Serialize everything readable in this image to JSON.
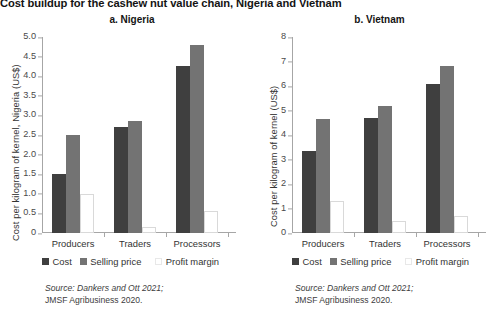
{
  "figure": {
    "title": "Cost buildup for the cashew nut value chain, Nigeria and Vietnam"
  },
  "legend": {
    "cost_label": "Cost",
    "selling_label": "Selling price",
    "profit_label": "Profit margin",
    "cost_color": "#3f3f3f",
    "selling_color": "#737373",
    "profit_color": "#ffffff"
  },
  "source": {
    "line1": "Source: Dankers and Ott 2021;",
    "line2": "JMSF Agribusiness 2020."
  },
  "chart_data": [
    {
      "type": "bar",
      "title": "a. Nigeria",
      "xlabel": "",
      "ylabel": "Cost per kilogram of kernel, Nigeria (US$)",
      "ylim": [
        0,
        5.0
      ],
      "ytick_step": 0.5,
      "ytick_labels": [
        "5.0",
        "4.5",
        "4.0",
        "3.5",
        "3.0",
        "2.5",
        "2.0",
        "1.5",
        "1.0",
        "0.5",
        "0"
      ],
      "ytick_values": [
        5.0,
        4.5,
        4.0,
        3.5,
        3.0,
        2.5,
        2.0,
        1.5,
        1.0,
        0.5,
        0
      ],
      "grid": false,
      "legend_position": "bottom",
      "categories": [
        "Producers",
        "Traders",
        "Processors"
      ],
      "series": [
        {
          "name": "Cost",
          "values": [
            1.5,
            2.7,
            4.25
          ]
        },
        {
          "name": "Selling price",
          "values": [
            2.5,
            2.85,
            4.8
          ]
        },
        {
          "name": "Profit margin",
          "values": [
            1.0,
            0.15,
            0.55
          ]
        }
      ]
    },
    {
      "type": "bar",
      "title": "b. Vietnam",
      "xlabel": "",
      "ylabel": "Cost per kilogram of kernel (US$)",
      "ylim": [
        0,
        8
      ],
      "ytick_step": 1,
      "ytick_labels": [
        "8",
        "7",
        "6",
        "5",
        "4",
        "3",
        "2",
        "1",
        "0"
      ],
      "ytick_values": [
        8,
        7,
        6,
        5,
        4,
        3,
        2,
        1,
        0
      ],
      "grid": false,
      "legend_position": "bottom",
      "categories": [
        "Producers",
        "Traders",
        "Processors"
      ],
      "series": [
        {
          "name": "Cost",
          "values": [
            3.35,
            4.7,
            6.1
          ]
        },
        {
          "name": "Selling price",
          "values": [
            4.65,
            5.2,
            6.8
          ]
        },
        {
          "name": "Profit margin",
          "values": [
            1.3,
            0.5,
            0.7
          ]
        }
      ]
    }
  ]
}
